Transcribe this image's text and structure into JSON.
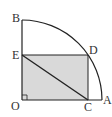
{
  "diagram": {
    "type": "geometry",
    "points": {
      "O": {
        "label": "O"
      },
      "A": {
        "label": "A"
      },
      "B": {
        "label": "B"
      },
      "C": {
        "label": "C"
      },
      "D": {
        "label": "D"
      },
      "E": {
        "label": "E"
      }
    },
    "colors": {
      "line": "#222222",
      "fill": "#d9d9d9"
    }
  }
}
